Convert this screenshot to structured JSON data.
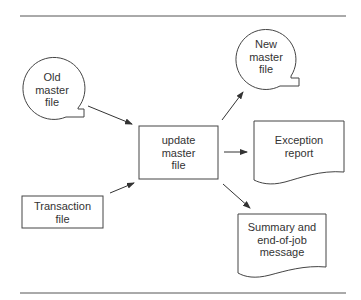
{
  "diagram": {
    "type": "system flowchart",
    "nodes": {
      "old_master": {
        "shape": "magnetic-tape",
        "label": "Old\nmaster\nfile"
      },
      "transaction": {
        "shape": "rectangle",
        "label": "Transaction\nfile"
      },
      "update": {
        "shape": "process",
        "label": "update\nmaster\nfile"
      },
      "new_master": {
        "shape": "magnetic-tape",
        "label": "New\nmaster\nfile"
      },
      "exception": {
        "shape": "document",
        "label": "Exception\nreport"
      },
      "summary": {
        "shape": "document",
        "label": "Summary and\nend-of-job\nmessage"
      }
    },
    "edges": [
      {
        "from": "old_master",
        "to": "update"
      },
      {
        "from": "transaction",
        "to": "update"
      },
      {
        "from": "update",
        "to": "new_master"
      },
      {
        "from": "update",
        "to": "exception"
      },
      {
        "from": "update",
        "to": "summary"
      }
    ],
    "colors": {
      "stroke": "#444444",
      "background": "#ffffff"
    }
  }
}
